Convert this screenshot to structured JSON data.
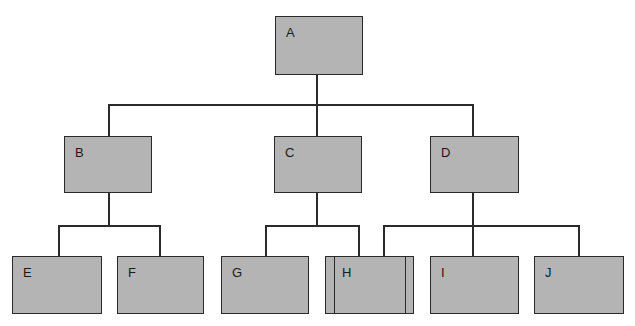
{
  "diagram": {
    "type": "org-chart",
    "nodes": [
      {
        "id": "A",
        "label": "A",
        "parent": null
      },
      {
        "id": "B",
        "label": "B",
        "parent": "A"
      },
      {
        "id": "C",
        "label": "C",
        "parent": "A"
      },
      {
        "id": "D",
        "label": "D",
        "parent": "A"
      },
      {
        "id": "E",
        "label": "E",
        "parent": "B"
      },
      {
        "id": "F",
        "label": "F",
        "parent": "B"
      },
      {
        "id": "G",
        "label": "G",
        "parent": "C"
      },
      {
        "id": "H",
        "label": "H",
        "parent": "C",
        "also_reports_to": "D",
        "style": "double-sided-border"
      },
      {
        "id": "I",
        "label": "I",
        "parent": "D"
      },
      {
        "id": "J",
        "label": "J",
        "parent": "D"
      }
    ],
    "colors": {
      "box_fill": "#b4b4b4",
      "line": "#2a2a2a",
      "background": "#ffffff"
    }
  }
}
